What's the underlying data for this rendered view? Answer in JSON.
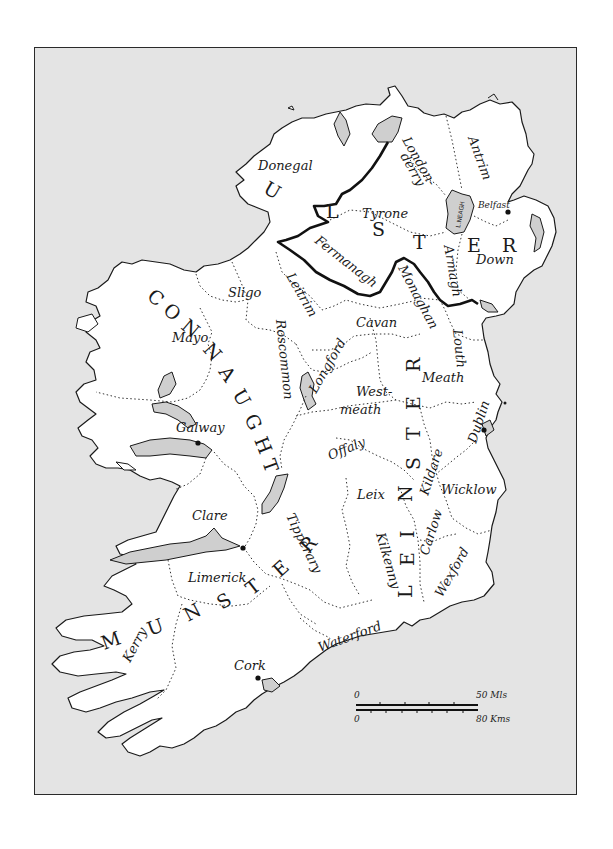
{
  "map": {
    "title": "Provinces and Counties of Ireland",
    "colors": {
      "sea": "#e4e4e4",
      "land": "#ffffff",
      "lakes": "#cfcfcf",
      "frame": "#2a2a2a",
      "ink": "#1a1a1a"
    },
    "provinces": [
      {
        "name": "ULSTER",
        "letters": [
          "U",
          "L",
          "S",
          "T",
          "E",
          "R"
        ]
      },
      {
        "name": "CONNAUGHT",
        "letters": [
          "C",
          "O",
          "N",
          "N",
          "A",
          "U",
          "G",
          "H",
          "T"
        ]
      },
      {
        "name": "LEINSTER",
        "letters": [
          "L",
          "E",
          "I",
          "N",
          "S",
          "T",
          "E",
          "R"
        ]
      },
      {
        "name": "MUNSTER",
        "letters": [
          "M",
          "U",
          "N",
          "S",
          "T",
          "E",
          "R"
        ]
      }
    ],
    "counties": {
      "donegal": "Donegal",
      "londonderry_1": "London-",
      "londonderry_2": "derry",
      "antrim": "Antrim",
      "tyrone": "Tyrone",
      "fermanagh": "Fermanagh",
      "armagh": "Armagh",
      "down": "Down",
      "monaghan": "Monaghan",
      "cavan": "Cavan",
      "louth": "Louth",
      "sligo": "Sligo",
      "leitrim": "Leitrim",
      "mayo": "Mayo",
      "roscommon": "Roscommon",
      "longford": "Longford",
      "westmeath_1": "West-",
      "westmeath_2": "meath",
      "meath": "Meath",
      "dublin": "Dublin",
      "galway": "Galway",
      "offaly": "Offaly",
      "kildare": "Kildare",
      "wicklow": "Wicklow",
      "leix": "Leix",
      "carlow": "Carlow",
      "kilkenny": "Kilkenny",
      "wexford": "Wexford",
      "clare": "Clare",
      "tipperary": "Tipperary",
      "limerick": "Limerick",
      "kerry": "Kerry",
      "cork": "Cork",
      "waterford": "Waterford"
    },
    "cities": [
      {
        "name": "Belfast",
        "label": "Belfast"
      },
      {
        "name": "Dublin"
      },
      {
        "name": "Galway"
      },
      {
        "name": "Limerick"
      },
      {
        "name": "Cork"
      }
    ],
    "lakes": {
      "lough_neagh": "L.NEAGH"
    },
    "scale": {
      "miles_zero": "0",
      "miles_max": "50 Mls",
      "km_zero": "0",
      "km_max": "80 Kms"
    }
  }
}
